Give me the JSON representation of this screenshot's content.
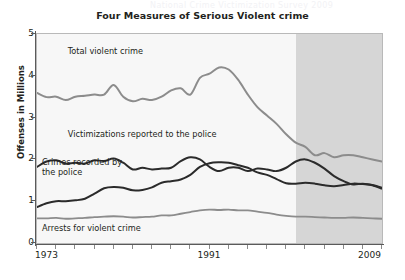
{
  "ghost_text": "National Crime Victimization Survey 2009",
  "chart_data": {
    "type": "line",
    "title": "Four Measures of Serious Violent crime",
    "xlabel": "",
    "ylabel": "Offenses in Millions",
    "xlim": [
      1973,
      2009
    ],
    "ylim": [
      0,
      5
    ],
    "grid": false,
    "legend_position": "inline-annotations",
    "x_tick_labels": [
      "1973",
      "1991",
      "2009"
    ],
    "x_tick_values": [
      1973,
      1991,
      2009
    ],
    "x_minor_tick_step": 2,
    "y_tick_labels": [
      "0",
      "1",
      "2",
      "3",
      "4",
      "5"
    ],
    "y_tick_values": [
      0,
      1,
      2,
      3,
      4,
      5
    ],
    "shaded_region": {
      "from": 2000,
      "to": 2009,
      "color": "#d6d6d6",
      "label": ""
    },
    "plot_background": "#f7f7f7",
    "x": [
      1973,
      1974,
      1975,
      1976,
      1977,
      1978,
      1979,
      1980,
      1981,
      1982,
      1983,
      1984,
      1985,
      1986,
      1987,
      1988,
      1989,
      1990,
      1991,
      1992,
      1993,
      1994,
      1995,
      1996,
      1997,
      1998,
      1999,
      2000,
      2001,
      2002,
      2003,
      2004,
      2005,
      2006,
      2007,
      2008,
      2009
    ],
    "series": [
      {
        "name": "Total violent crime",
        "color": "#8c8c8c",
        "width": 2.0,
        "label_x": 1976,
        "label_y": 4.55,
        "values": [
          3.59,
          3.49,
          3.5,
          3.42,
          3.5,
          3.52,
          3.55,
          3.55,
          3.78,
          3.5,
          3.39,
          3.45,
          3.42,
          3.5,
          3.65,
          3.7,
          3.55,
          3.95,
          4.05,
          4.2,
          4.15,
          3.9,
          3.55,
          3.25,
          3.05,
          2.85,
          2.6,
          2.4,
          2.3,
          2.1,
          2.15,
          2.05,
          2.1,
          2.1,
          2.05,
          2.0,
          1.95
        ]
      },
      {
        "name": "Victimizations reported to the police",
        "color": "#2b2b2b",
        "width": 2.0,
        "label_x": 1976,
        "label_y": 2.55,
        "values": [
          1.82,
          1.95,
          1.98,
          1.9,
          1.92,
          1.9,
          1.98,
          1.96,
          2.02,
          1.92,
          1.76,
          1.8,
          1.76,
          1.78,
          1.8,
          1.96,
          2.05,
          2.0,
          1.82,
          1.72,
          1.8,
          1.8,
          1.72,
          1.78,
          1.76,
          1.72,
          1.8,
          1.95,
          2.0,
          1.92,
          1.78,
          1.6,
          1.48,
          1.4,
          1.42,
          1.38,
          1.3
        ]
      },
      {
        "name": "Crimes recorded by\nthe police",
        "color": "#2b2b2b",
        "width": 2.0,
        "label_x": 1973.3,
        "label_y": 1.88,
        "values": [
          0.86,
          0.95,
          1.0,
          1.0,
          1.02,
          1.06,
          1.18,
          1.31,
          1.34,
          1.32,
          1.26,
          1.27,
          1.33,
          1.44,
          1.48,
          1.52,
          1.63,
          1.82,
          1.91,
          1.93,
          1.92,
          1.86,
          1.8,
          1.69,
          1.63,
          1.53,
          1.43,
          1.42,
          1.44,
          1.42,
          1.38,
          1.36,
          1.39,
          1.42,
          1.41,
          1.39,
          1.32
        ]
      },
      {
        "name": "Arrests for violent crime",
        "color": "#8c8c8c",
        "width": 1.8,
        "label_x": 1973.3,
        "label_y": 0.3,
        "values": [
          0.59,
          0.59,
          0.6,
          0.58,
          0.59,
          0.6,
          0.62,
          0.63,
          0.64,
          0.63,
          0.61,
          0.62,
          0.63,
          0.66,
          0.66,
          0.7,
          0.74,
          0.78,
          0.8,
          0.79,
          0.8,
          0.78,
          0.78,
          0.75,
          0.72,
          0.68,
          0.65,
          0.63,
          0.63,
          0.62,
          0.61,
          0.6,
          0.6,
          0.61,
          0.6,
          0.59,
          0.58
        ]
      }
    ]
  }
}
